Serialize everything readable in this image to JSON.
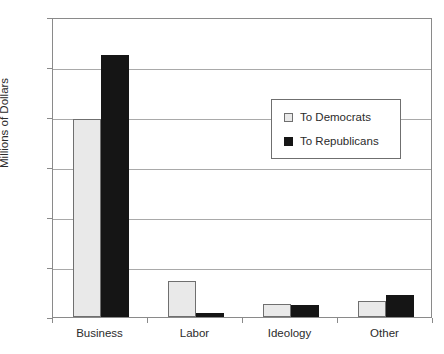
{
  "chart_data": {
    "type": "bar",
    "title": "",
    "xlabel": "",
    "ylabel": "Millions of Dollars",
    "categories": [
      "Business",
      "Labor",
      "Ideology",
      "Other"
    ],
    "series": [
      {
        "name": "To Democrats",
        "color": "#e9e9e9",
        "values": [
          198,
          36,
          13,
          16
        ]
      },
      {
        "name": "To Republicans",
        "color": "#151515",
        "values": [
          262,
          4,
          12,
          22
        ]
      }
    ],
    "ylim": [
      0,
      300
    ],
    "yticks": [
      0,
      50,
      100,
      150,
      200,
      250,
      300
    ],
    "ytick_labels": [
      "0",
      "50",
      "100",
      "150",
      "200",
      "250",
      "300"
    ],
    "grid": true,
    "legend_position": "upper center"
  }
}
